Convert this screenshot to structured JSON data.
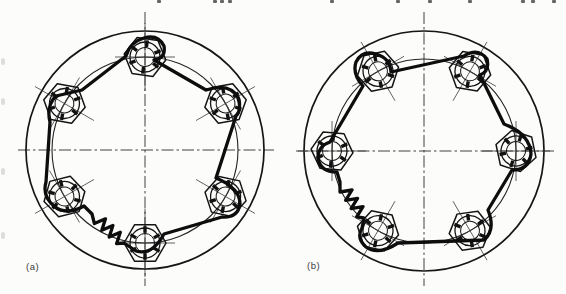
{
  "page": {
    "width": 566,
    "height": 294,
    "background": "#fcfcfb",
    "ink": "#0d0d0d"
  },
  "figure_kind": "engineering line drawing: lock-wired castellated nuts on circular flange, two variants",
  "panels": [
    {
      "id": "a",
      "label": "(a)",
      "label_pos": {
        "x": 26,
        "y": 261
      },
      "cx": 145,
      "cy": 150,
      "outer_r": 119,
      "pitch_r": 93,
      "v_ext": [
        12,
        286
      ],
      "h_ext": [
        18,
        274
      ],
      "bolt_angles": [
        90,
        30,
        330,
        270,
        210,
        150
      ],
      "bolt_rotations": [
        8,
        -10,
        12,
        0,
        -14,
        10
      ],
      "nut": {
        "hex_r": 21,
        "ring_r": 15,
        "bore_r": 9.5,
        "slots": 6
      },
      "wire_d": "M 82 90 L 126 56 Q 130 42 144 38 Q 158 34 164 46 Q 166 58 154 60 L 206 90 Q 230 82 238 98 Q 242 110 236 116 L 216 178 Q 240 188 240 204 Q 238 218 222 217 L 164 234 Q 152 256 136 251 L 124 243 L 116.6 243.7 L 120.3 232.2 L 109.2 237 L 112.9 225.5 L 101.8 230.3 L 105.5 218.8 L 94.4 223.6 L 92 214 L 84 206 Q 66 216 54 206 Q 42 196 46 182 L 50 122 Q 46 106 56 96 L 82 90 Z",
      "spring_span": "between bottom nut (270°) and lower-left nut (210°)"
    },
    {
      "id": "b",
      "label": "(b)",
      "label_pos": {
        "x": 307,
        "y": 260
      },
      "cx": 424,
      "cy": 151,
      "outer_r": 120,
      "pitch_r": 92,
      "v_ext": [
        12,
        286
      ],
      "h_ext": [
        296,
        556
      ],
      "bolt_angles": [
        180,
        120,
        60,
        0,
        300,
        240
      ],
      "bolt_rotations": [
        5,
        -12,
        10,
        18,
        -8,
        12
      ],
      "nut": {
        "hex_r": 21,
        "ring_r": 15,
        "bore_r": 9.5,
        "slots": 6
      },
      "wire_d": "M 363 86 Q 352 74 356 62 Q 362 50 376 54 Q 390 58 391 72 L 464 56 Q 478 47 487 59 Q 490 71 480 75 L 504 124 Q 530 134 531 154 Q 529 170 512 170 L 488 210 Q 496 230 484 240 L 398 243 Q 378 256 366 247 Q 356 238 362 228 L 364 218 L 356.7 216.9 L 363 206.6 L 351.1 208.6 L 357.5 198.3 L 345.6 200.3 L 352 190 L 340 192 L 340 182 L 337 172 Q 320 172 318 158 Q 318 146 330 142 L 363 86 Z",
      "spring_span": "between lower-left nut (240°) and left nut (180°)"
    }
  ],
  "artifacts": {
    "top_edge_marks_x": [
      157,
      213,
      220,
      228,
      330,
      396,
      428,
      468,
      521,
      531,
      552
    ],
    "left_edge_specks_y": [
      58,
      98,
      168,
      232
    ]
  },
  "colors": {
    "outer_circle": "#161616",
    "pitch_circle": "#222222",
    "wire": "#0d0d0d",
    "centerline": "#2e2e2e",
    "label_text": "#3c3c3c"
  }
}
